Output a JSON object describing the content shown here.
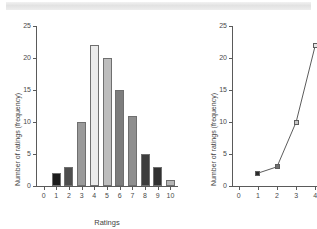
{
  "banner": {
    "present": true,
    "color": "#e6e6e6"
  },
  "chart_data": [
    {
      "id": "histogram",
      "type": "bar",
      "title": "",
      "xlabel": "Ratings",
      "ylabel": "Number of ratings (frequency)",
      "categories": [
        0,
        1,
        2,
        3,
        4,
        5,
        6,
        7,
        8,
        9,
        10
      ],
      "values": [
        0,
        2,
        3,
        10,
        22,
        20,
        15,
        11,
        5,
        3,
        1
      ],
      "bar_colors": [
        "#ffffff",
        "#1c1c1c",
        "#4e4e4e",
        "#9a9a9a",
        "#ebebeb",
        "#bdbdbd",
        "#7d7d7d",
        "#8e8e8e",
        "#3d3d3d",
        "#313131",
        "#b5b5b5"
      ],
      "xticks": [
        0,
        1,
        2,
        3,
        4,
        5,
        6,
        7,
        8,
        9,
        10
      ],
      "yticks": [
        0,
        5,
        10,
        15,
        20,
        25
      ],
      "xlim": [
        -0.6,
        10.6
      ],
      "ylim": [
        0,
        25
      ],
      "grid": false,
      "legend": "none"
    },
    {
      "id": "lineplot",
      "type": "line",
      "title": "",
      "xlabel": "",
      "ylabel": "Number of ratings (frequency)",
      "x": [
        1,
        2,
        3,
        4
      ],
      "values": [
        2,
        3,
        10,
        22
      ],
      "marker_colors": [
        "#2b2b2b",
        "#707070",
        "#c6c6c6",
        "#e4e4e4"
      ],
      "marker_shape": "square",
      "line_color": "#4a4a4a",
      "xticks": [
        0,
        1,
        2,
        3,
        4
      ],
      "yticks": [
        0,
        5,
        10,
        15,
        20,
        25
      ],
      "xlim": [
        -0.35,
        4.35
      ],
      "ylim": [
        0,
        25
      ],
      "grid": false,
      "legend": "none",
      "clipped_right": true
    }
  ]
}
